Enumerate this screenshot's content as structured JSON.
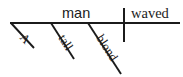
{
  "diagram": {
    "type": "reed-kellogg-sentence-diagram",
    "sentence": "A tall blond man waved",
    "colors": {
      "ink": "#1b1b1b",
      "background": "#ffffff"
    },
    "baseline": {
      "label": "baseline",
      "x1": 10,
      "y1": 23,
      "x2": 180,
      "y2": 23
    },
    "divider": {
      "label": "subject-predicate-divider",
      "x": 124,
      "y1": 8,
      "y2": 42
    },
    "subject": {
      "word": "man",
      "x": 62,
      "y": 18
    },
    "predicate": {
      "word": "waved",
      "x": 131,
      "y": 18
    },
    "modifiers": [
      {
        "word": "A",
        "attach_x": 11,
        "attach_y": 23,
        "end_x": 34,
        "end_y": 48,
        "text_x": 19,
        "text_y": 38,
        "angle": 47
      },
      {
        "word": "tall",
        "attach_x": 51,
        "attach_y": 23,
        "end_x": 74,
        "end_y": 59,
        "text_x": 58,
        "text_y": 38,
        "angle": 57
      },
      {
        "word": "blond",
        "attach_x": 88,
        "attach_y": 23,
        "end_x": 121,
        "end_y": 74,
        "text_x": 96,
        "text_y": 38,
        "angle": 57
      }
    ]
  }
}
